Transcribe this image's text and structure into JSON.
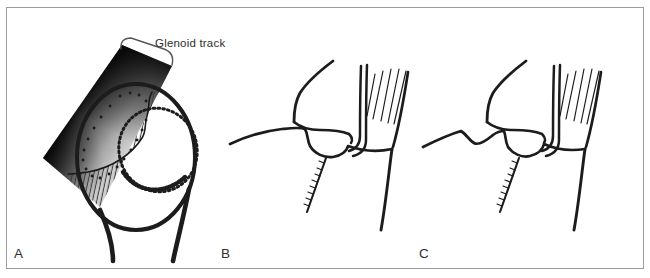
{
  "figure": {
    "annotation": {
      "label": "Glenoid track"
    },
    "panels": [
      {
        "letter": "A"
      },
      {
        "letter": "B"
      },
      {
        "letter": "C"
      }
    ],
    "colors": {
      "background": "#ffffff",
      "frame": "#9c9c9c",
      "ink": "#1c1c1c",
      "band_dark": "#101010",
      "band_light": "#cfcfcf"
    }
  }
}
